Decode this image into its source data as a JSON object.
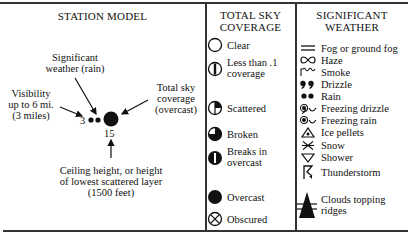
{
  "station_model": {
    "title": "STATION MODEL",
    "significant_weather_label": [
      "Significant",
      "weather (rain)"
    ],
    "visibility_label": [
      "Visibility",
      "up to 6 mi.",
      "(3 miles)"
    ],
    "sky_coverage_label": [
      "Total sky",
      "coverage",
      "(overcast)"
    ],
    "visibility_value": "3",
    "ceiling_value": "15",
    "ceiling_label": [
      "Ceiling height, or height",
      "of lowest scattered layer",
      "(1500 feet)"
    ]
  },
  "sky_coverage": {
    "title": [
      "TOTAL SKY",
      "COVERAGE"
    ],
    "items": [
      {
        "icon": "clear-circle-icon",
        "label": [
          "Clear"
        ]
      },
      {
        "icon": "less-than-tenth-icon",
        "label": [
          "Less than .1",
          "coverage"
        ]
      },
      {
        "icon": "scattered-icon",
        "label": [
          "Scattered"
        ]
      },
      {
        "icon": "broken-icon",
        "label": [
          "Broken"
        ]
      },
      {
        "icon": "breaks-in-overcast-icon",
        "label": [
          "Breaks in",
          "overcast"
        ]
      },
      {
        "icon": "overcast-icon",
        "label": [
          "Overcast"
        ]
      },
      {
        "icon": "obscured-icon",
        "label": [
          "Obscured"
        ]
      }
    ]
  },
  "significant_weather": {
    "title": [
      "SIGNIFICANT",
      "WEATHER"
    ],
    "items": [
      {
        "icon": "fog-icon",
        "label": "Fog or ground fog"
      },
      {
        "icon": "haze-icon",
        "label": "Haze"
      },
      {
        "icon": "smoke-icon",
        "label": "Smoke"
      },
      {
        "icon": "drizzle-icon",
        "label": "Drizzle"
      },
      {
        "icon": "rain-icon",
        "label": "Rain"
      },
      {
        "icon": "freezing-drizzle-icon",
        "label": "Freezing drizzle"
      },
      {
        "icon": "freezing-rain-icon",
        "label": "Freezing rain"
      },
      {
        "icon": "ice-pellets-icon",
        "label": "Ice pellets"
      },
      {
        "icon": "snow-icon",
        "label": "Snow"
      },
      {
        "icon": "shower-icon",
        "label": "Shower"
      },
      {
        "icon": "thunderstorm-icon",
        "label": "Thunderstorm"
      },
      {
        "icon": "clouds-topping-ridges-icon",
        "label": [
          "Clouds topping",
          "ridges"
        ]
      }
    ]
  }
}
